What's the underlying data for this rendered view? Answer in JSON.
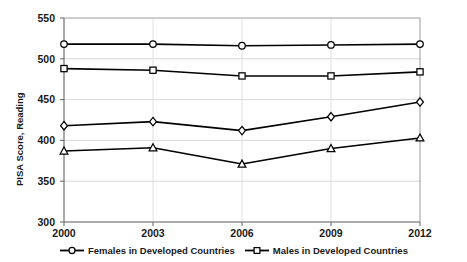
{
  "chart_data": {
    "type": "line",
    "title": "",
    "subtitle": "",
    "xlabel": "",
    "ylabel": "PISA Score, Reading",
    "categories": [
      "2000",
      "2003",
      "2006",
      "2009",
      "2012"
    ],
    "x": [
      2000,
      2003,
      2006,
      2009,
      2012
    ],
    "xlim": [
      2000,
      2012
    ],
    "ylim": [
      300,
      550
    ],
    "yticks": [
      300,
      350,
      400,
      450,
      500,
      550
    ],
    "xticks": [
      "2000",
      "2003",
      "2006",
      "2009",
      "2012"
    ],
    "grid": "horizontal-and-vertical-light",
    "legend_position": "bottom",
    "line_color": "#000000",
    "marker_fill": "#ffffff",
    "series": [
      {
        "name": "Females in Developed Countries",
        "marker": "circle",
        "in_legend": true,
        "values": [
          518,
          518,
          516,
          517,
          518
        ]
      },
      {
        "name": "Males in Developed Countries",
        "marker": "square",
        "in_legend": true,
        "values": [
          488,
          486,
          479,
          479,
          484
        ]
      },
      {
        "name": "",
        "marker": "diamond",
        "in_legend": false,
        "values": [
          418,
          423,
          412,
          429,
          447
        ]
      },
      {
        "name": "",
        "marker": "triangle",
        "in_legend": false,
        "values": [
          387,
          391,
          371,
          390,
          403
        ]
      }
    ]
  },
  "legend": {
    "items": [
      {
        "label": "Females in Developed Countries",
        "marker": "circle"
      },
      {
        "label": "Males in Developed Countries",
        "marker": "square"
      }
    ]
  }
}
